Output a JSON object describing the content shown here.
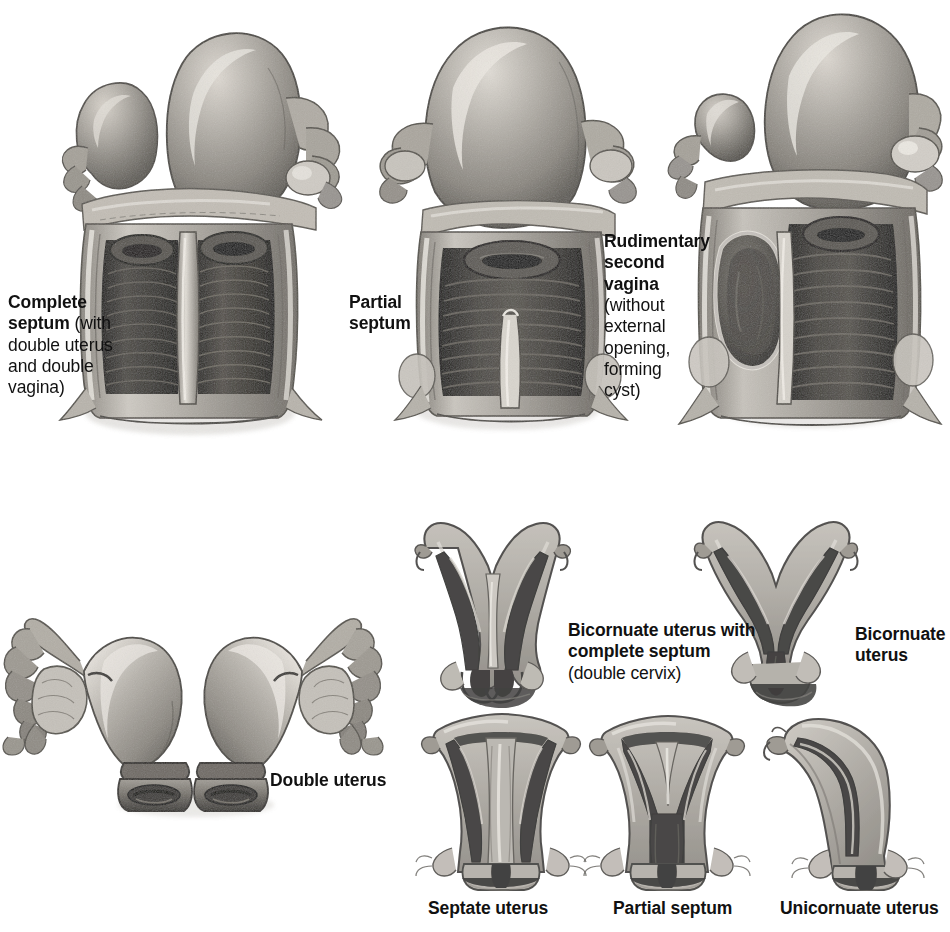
{
  "plate": {
    "title": "Malformations of the Uterus and Vagina",
    "background_color": "#ffffff",
    "ink_color": "#111111",
    "medium": "grayscale anatomical illustration / halftone print"
  },
  "palette": {
    "tissue_light": "#c9c6c0",
    "tissue_mid": "#9a968f",
    "tissue_dark": "#6b6760",
    "cavity_dark": "#2b2a27",
    "cavity_black": "#151413",
    "highlight": "#e6e3dd",
    "serosa": "#b4b0a8",
    "shadow": "#4a4742"
  },
  "labels": {
    "complete_septum": {
      "bold": "Complete septum",
      "regular": " (with double uterus and double vagina)",
      "line1_bold": "Complete",
      "line2_bold": "septum",
      "line2_regular": " (with",
      "line3": "double uterus",
      "line4": "and double",
      "line5": "vagina)"
    },
    "partial_septum_top": {
      "line1": "Partial",
      "line2": "septum"
    },
    "rudimentary_second_vagina": {
      "line1_bold": "Rudimentary",
      "line2_bold": "second",
      "line3_bold": "vagina",
      "line4": "(without",
      "line5": "external",
      "line6": "opening,",
      "line7": "forming",
      "line8": "cyst)"
    },
    "double_uterus": "Double uterus",
    "bicornuate_with_complete_septum": {
      "line1_bold": "Bicornuate uterus with",
      "line2_bold": "complete septum",
      "line3_regular": "(double cervix)"
    },
    "bicornuate_uterus": {
      "line1": "Bicornuate",
      "line2": "uterus"
    },
    "septate_uterus": "Septate uterus",
    "partial_septum_bottom": "Partial septum",
    "unicornuate_uterus": "Unicornuate uterus"
  },
  "figures": [
    {
      "id": "complete-septum-specimen",
      "caption": "Complete septum (with double uterus and double vagina)",
      "view": "anterior, vagina opened longitudinally",
      "features": [
        "two uterine fundi of unequal size",
        "two ovaries",
        "two cervical os",
        "complete longitudinal vaginal septum",
        "vaginal rugae"
      ]
    },
    {
      "id": "partial-septum-specimen",
      "caption": "Partial septum",
      "view": "anterior, vagina opened longitudinally",
      "features": [
        "single uterine fundus",
        "single cervix",
        "partial longitudinal vaginal septum in lower vagina",
        "vaginal rugae"
      ]
    },
    {
      "id": "rudimentary-second-vagina-specimen",
      "caption": "Rudimentary second vagina (without external opening, forming cyst)",
      "view": "anterior, vagina opened longitudinally",
      "features": [
        "two uterine fundi of unequal size",
        "blind cystic second vaginal cavity on left",
        "patent main vagina with rugae"
      ]
    },
    {
      "id": "double-uterus-specimen",
      "caption": "Double uterus",
      "view": "posterior, external",
      "features": [
        "two separate uterine bodies",
        "two cervices",
        "bilateral fallopian tubes",
        "bilateral ovaries"
      ]
    },
    {
      "id": "bicornuate-uterus-with-complete-septum",
      "caption": "Bicornuate uterus with complete septum (double cervix)",
      "view": "coronal section",
      "features": [
        "deeply divided external fundus",
        "complete septum to cervix",
        "two cervical canals"
      ]
    },
    {
      "id": "bicornuate-uterus",
      "caption": "Bicornuate uterus",
      "view": "coronal section",
      "features": [
        "deeply divided external fundus",
        "two horns joining a single cervical canal"
      ]
    },
    {
      "id": "septate-uterus",
      "caption": "Septate uterus",
      "view": "coronal section",
      "features": [
        "flat or convex external fundus",
        "full-length internal septum",
        "single cervix"
      ]
    },
    {
      "id": "partial-septum-coronal",
      "caption": "Partial septum",
      "view": "coronal section",
      "features": [
        "flat external fundus",
        "partial septum forming Y-shaped cavity",
        "single cervix"
      ]
    },
    {
      "id": "unicornuate-uterus",
      "caption": "Unicornuate uterus",
      "view": "coronal section",
      "features": [
        "single banana-shaped horn",
        "single fallopian tube",
        "single cervix"
      ]
    }
  ]
}
